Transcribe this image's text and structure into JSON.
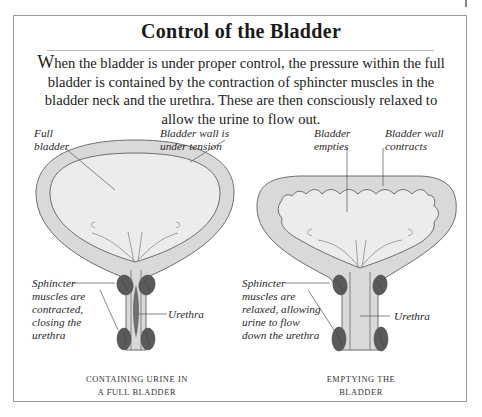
{
  "title": "Control of the Bladder",
  "intro": {
    "dropcap": "W",
    "text": "hen the bladder is under proper control, the pressure within the full bladder is contained by the contraction of sphincter muscles in the bladder neck and the urethra. These are then consciously relaxed to allow the urine to flow out."
  },
  "colors": {
    "wall_fill": "#d9d9d9",
    "interior_fill": "#ececec",
    "outline": "#6e6e6e",
    "sphincter": "#5a5a5a",
    "urethra_closed": "#707070",
    "frame_border": "#9a9a9a"
  },
  "panels": [
    {
      "id": "full",
      "labels": {
        "full_bladder": "Full\nbladder",
        "wall_tension": "Bladder wall is\nunder tension",
        "sphincter": "Sphincter\nmuscles are\ncontracted,\nclosing the\nurethra",
        "urethra": "Urethra"
      },
      "caption": "CONTAINING URINE IN\nA FULL BLADDER"
    },
    {
      "id": "emptying",
      "labels": {
        "bladder_empties": "Bladder\nempties",
        "wall_contracts": "Bladder wall\ncontracts",
        "sphincter": "Sphincter\nmuscles are\nrelaxed, allowing\nurine to flow\ndown the urethra",
        "urethra": "Urethra"
      },
      "caption": "EMPTYING THE\nBLADDER"
    }
  ]
}
